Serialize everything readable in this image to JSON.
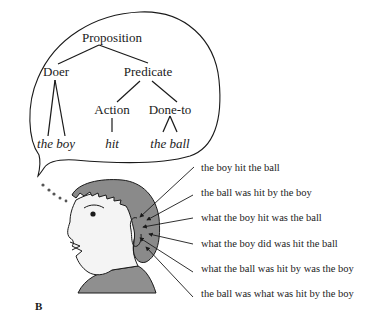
{
  "figure": {
    "panel_label": "B",
    "thought_bubble": {
      "tree": {
        "root": "Proposition",
        "nodes": {
          "doer": "Doer",
          "predicate": "Predicate",
          "action": "Action",
          "done_to": "Done-to"
        },
        "leaves": {
          "doer": "the boy",
          "action": "hit",
          "done_to": "the ball"
        }
      }
    },
    "sentences": [
      "the boy hit the ball",
      "the ball was hit by the boy",
      "what the boy hit was the ball",
      "what the boy did was hit the ball",
      "what the ball was hit by was the boy",
      "the ball was what was hit by the boy"
    ],
    "colors": {
      "hair": "#8a8a8a",
      "skin": "#f4f4f4",
      "shirt": "#8f8f8f",
      "ink": "#1a1a1a",
      "background": "#ffffff"
    }
  }
}
